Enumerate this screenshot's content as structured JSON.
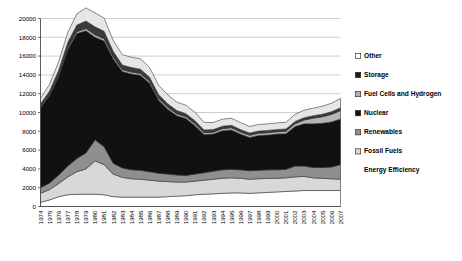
{
  "chart_data": {
    "type": "area",
    "stacked": true,
    "title": "",
    "subtitle": "",
    "xlabel": "",
    "ylabel": "",
    "xlim": [
      1974,
      2007
    ],
    "ylim": [
      0,
      20000
    ],
    "yticks": [
      0,
      2000,
      4000,
      6000,
      8000,
      10000,
      12000,
      14000,
      16000,
      18000,
      20000
    ],
    "ytick_labels": [
      "0",
      "2000",
      "4000",
      "6000",
      "8000",
      "10000",
      "12000",
      "14000",
      "16000",
      "18000",
      "20000"
    ],
    "grid": "horizontal",
    "legend_position": "right",
    "categories": [
      "1974",
      "1975",
      "1976",
      "1977",
      "1978",
      "1979",
      "1980",
      "1981",
      "1982",
      "1983",
      "1984",
      "1985",
      "1986",
      "1987",
      "1988",
      "1989",
      "1990",
      "1991",
      "1992",
      "1993",
      "1994",
      "1995",
      "1996",
      "1997",
      "1998",
      "1999",
      "2000",
      "2001",
      "2002",
      "2003",
      "2004",
      "2005",
      "2006",
      "2007"
    ],
    "x": [
      1974,
      1975,
      1976,
      1977,
      1978,
      1979,
      1980,
      1981,
      1982,
      1983,
      1984,
      1985,
      1986,
      1987,
      1988,
      1989,
      1990,
      1991,
      1992,
      1993,
      1994,
      1995,
      1996,
      1997,
      1998,
      1999,
      2000,
      2001,
      2002,
      2003,
      2004,
      2005,
      2006,
      2007
    ],
    "series": [
      {
        "name": "Energy Efficiency",
        "color": "#ffffff",
        "stack_order": 1,
        "values": [
          450,
          700,
          1050,
          1250,
          1300,
          1300,
          1300,
          1250,
          1050,
          1000,
          1000,
          1000,
          1000,
          1000,
          1050,
          1100,
          1150,
          1250,
          1300,
          1350,
          1400,
          1450,
          1450,
          1400,
          1450,
          1500,
          1550,
          1600,
          1650,
          1700,
          1700,
          1700,
          1700,
          1700
        ]
      },
      {
        "name": "Fossil Fuels",
        "color": "#d8d8d8",
        "stack_order": 2,
        "values": [
          950,
          1100,
          1400,
          1900,
          2400,
          2700,
          3550,
          3200,
          2400,
          2100,
          1950,
          1900,
          1800,
          1700,
          1600,
          1500,
          1450,
          1450,
          1500,
          1550,
          1600,
          1600,
          1550,
          1500,
          1500,
          1500,
          1450,
          1450,
          1500,
          1500,
          1350,
          1300,
          1250,
          1200
        ]
      },
      {
        "name": "Renewables",
        "color": "#8f8f8f",
        "stack_order": 3,
        "values": [
          600,
          700,
          900,
          1150,
          1400,
          1700,
          2250,
          1900,
          1150,
          1000,
          950,
          950,
          900,
          850,
          800,
          750,
          700,
          750,
          800,
          850,
          900,
          900,
          900,
          900,
          900,
          900,
          900,
          900,
          1150,
          1100,
          1100,
          1150,
          1250,
          1550
        ]
      },
      {
        "name": "Nuclear",
        "color": "#111111",
        "stack_order": 4,
        "values": [
          8500,
          9300,
          10500,
          12400,
          13300,
          13000,
          10900,
          11250,
          11100,
          10250,
          10200,
          10100,
          9400,
          7750,
          6900,
          6300,
          6050,
          5150,
          4050,
          3950,
          4150,
          4200,
          3800,
          3550,
          3700,
          3700,
          3800,
          3800,
          4200,
          4500,
          4650,
          4700,
          4800,
          4850
        ]
      },
      {
        "name": "Fuel Cells and Hydrogen",
        "color": "#b5b5b5",
        "stack_order": 5,
        "values": [
          100,
          120,
          150,
          170,
          200,
          230,
          260,
          240,
          210,
          200,
          200,
          200,
          200,
          200,
          200,
          200,
          200,
          200,
          200,
          200,
          220,
          230,
          230,
          230,
          240,
          250,
          250,
          260,
          300,
          400,
          600,
          700,
          800,
          900
        ]
      },
      {
        "name": "Storage",
        "color": "#3a3a3a",
        "stack_order": 6,
        "values": [
          300,
          380,
          500,
          600,
          700,
          800,
          850,
          800,
          600,
          500,
          480,
          460,
          440,
          400,
          380,
          350,
          330,
          320,
          300,
          280,
          270,
          260,
          250,
          240,
          240,
          240,
          240,
          240,
          250,
          250,
          260,
          270,
          280,
          300
        ]
      },
      {
        "name": "Other",
        "color": "#e6e6e6",
        "stack_order": 7,
        "values": [
          600,
          700,
          900,
          1050,
          1200,
          1400,
          1500,
          1400,
          1150,
          1100,
          1100,
          1100,
          1050,
          1000,
          950,
          900,
          900,
          900,
          800,
          750,
          750,
          750,
          750,
          700,
          700,
          700,
          700,
          700,
          750,
          800,
          800,
          850,
          900,
          1000
        ]
      }
    ],
    "totals": [
      11500,
      13000,
      15400,
      18520,
      20500,
      21130,
      20610,
      20040,
      17660,
      16150,
      15880,
      15710,
      14790,
      12900,
      11880,
      11100,
      10780,
      10020,
      8950,
      8930,
      9290,
      9390,
      8930,
      8520,
      8730,
      8790,
      8890,
      8950,
      9800,
      10250,
      10460,
      10670,
      10980,
      11500
    ]
  },
  "legend": {
    "items": [
      {
        "label": "Other",
        "swatch": "#ffffff"
      },
      {
        "label": "Storage",
        "swatch": "#1c1c1c"
      },
      {
        "label": "Fuel Cells and Hydrogen",
        "swatch": "#b5b5b5"
      },
      {
        "label": "Nuclear",
        "swatch": "#111111"
      },
      {
        "label": "Renewables",
        "swatch": "#8f8f8f"
      },
      {
        "label": "Fossil Fuels",
        "swatch": "#d8d8d8"
      },
      {
        "label": "Energy Efficiency",
        "swatch": "#ffffff"
      }
    ]
  }
}
